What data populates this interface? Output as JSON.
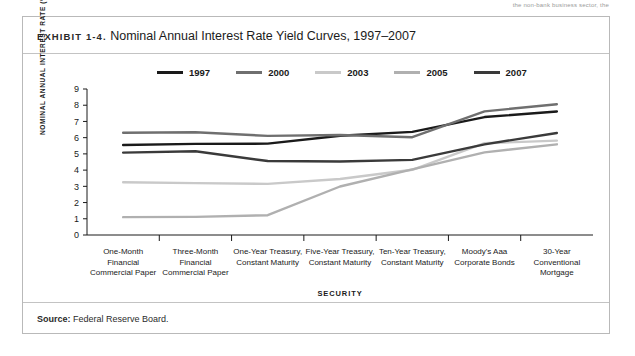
{
  "top_note": "the non-bank business sector, the",
  "exhibit": {
    "label": "EXHIBIT 1-4.",
    "title": "Nominal Annual Interest Rate Yield Curves, 1997–2007"
  },
  "source": {
    "label": "Source:",
    "text": "Federal Reserve Board."
  },
  "chart_data": {
    "type": "line",
    "title": "Nominal Annual Interest Rate Yield Curves, 1997–2007",
    "xlabel": "SECURITY",
    "ylabel": "NOMINAL ANNUAL INTEREST RATE (%)",
    "ylim": [
      0,
      9
    ],
    "yticks": [
      "0",
      "1",
      "2",
      "3",
      "4",
      "5",
      "6",
      "7",
      "8",
      "9"
    ],
    "grid": false,
    "legend_position": "top",
    "categories": [
      "One-Month\nFinancial\nCommercial Paper",
      "Three-Month\nFinancial\nCommercial Paper",
      "One-Year Treasury,\nConstant Maturity",
      "Five-Year Treasury,\nConstant Maturity",
      "Ten-Year Treasury,\nConstant Maturity",
      "Moody's Aaa\nCorporate Bonds",
      "30-Year\nConventional\nMortgage"
    ],
    "categories_display": [
      [
        "One-Month",
        "Financial",
        "Commercial Paper"
      ],
      [
        "Three-Month",
        "Financial",
        "Commercial Paper"
      ],
      [
        "One-Year Treasury,",
        "Constant Maturity"
      ],
      [
        "Five-Year Treasury,",
        "Constant Maturity"
      ],
      [
        "Ten-Year Treasury,",
        "Constant Maturity"
      ],
      [
        "Moody's Aaa",
        "Corporate Bonds"
      ],
      [
        "30-Year",
        "Conventional",
        "Mortgage"
      ]
    ],
    "series": [
      {
        "name": "1997",
        "color": "#1a1a1a",
        "values": [
          5.55,
          5.62,
          5.63,
          6.12,
          6.36,
          7.27,
          7.61
        ]
      },
      {
        "name": "2000",
        "color": "#6f6f6f",
        "values": [
          6.3,
          6.33,
          6.11,
          6.16,
          6.03,
          7.62,
          8.06
        ]
      },
      {
        "name": "2003",
        "color": "#c9c9c9",
        "values": [
          3.25,
          3.2,
          3.15,
          3.45,
          4.02,
          5.66,
          5.82
        ]
      },
      {
        "name": "2005",
        "color": "#b0b0b0",
        "values": [
          1.1,
          1.12,
          1.22,
          2.99,
          4.05,
          5.09,
          5.59
        ]
      },
      {
        "name": "2007",
        "color": "#3a3a3a",
        "values": [
          5.08,
          5.16,
          4.56,
          4.53,
          4.63,
          5.59,
          6.29
        ]
      }
    ]
  }
}
